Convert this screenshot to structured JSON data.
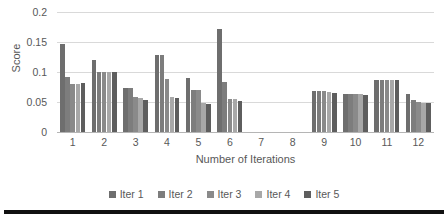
{
  "chart_data": {
    "type": "bar",
    "title": "",
    "xlabel": "Number of Iterations",
    "ylabel": "Score",
    "categories": [
      "1",
      "2",
      "3",
      "4",
      "5",
      "6",
      "7",
      "8",
      "9",
      "10",
      "11",
      "12"
    ],
    "ylim": [
      0,
      0.2
    ],
    "ytick_labels": [
      "0.2",
      "0.15",
      "0.1",
      "0.05",
      "0"
    ],
    "ytick_values": [
      0.2,
      0.15,
      0.1,
      0.05,
      0
    ],
    "grid": true,
    "legend_position": "bottom",
    "series": [
      {
        "name": "Iter 1",
        "color": "#6e6e6e",
        "values": [
          0.147,
          0.12,
          0.073,
          0.128,
          0.09,
          0.172,
          0.0,
          0.0,
          0.068,
          0.063,
          0.086,
          0.064
        ]
      },
      {
        "name": "Iter 2",
        "color": "#7d7d7d",
        "values": [
          0.092,
          0.1,
          0.073,
          0.128,
          0.07,
          0.084,
          0.0,
          0.0,
          0.068,
          0.063,
          0.086,
          0.053
        ]
      },
      {
        "name": "Iter 3",
        "color": "#8a8a8a",
        "values": [
          0.08,
          0.1,
          0.059,
          0.088,
          0.07,
          0.055,
          0.0,
          0.0,
          0.068,
          0.063,
          0.086,
          0.05
        ]
      },
      {
        "name": "Iter 4",
        "color": "#a8a8a8",
        "values": [
          0.08,
          0.1,
          0.056,
          0.058,
          0.048,
          0.055,
          0.0,
          0.0,
          0.067,
          0.063,
          0.086,
          0.049
        ]
      },
      {
        "name": "Iter 5",
        "color": "#5e5e5e",
        "values": [
          0.081,
          0.1,
          0.054,
          0.057,
          0.047,
          0.052,
          0.0,
          0.0,
          0.065,
          0.062,
          0.086,
          0.049
        ]
      }
    ]
  }
}
